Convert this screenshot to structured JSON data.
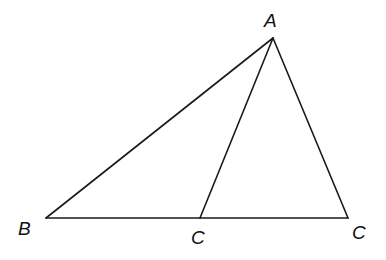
{
  "diagram": {
    "type": "triangle-with-cevian",
    "points": {
      "A": {
        "label": "A",
        "x": 273,
        "y": 38
      },
      "B": {
        "label": "B",
        "x": 46,
        "y": 218
      },
      "C_mid": {
        "label": "C",
        "x": 200,
        "y": 218
      },
      "C_right": {
        "label": "C",
        "x": 348,
        "y": 218
      }
    },
    "segments": [
      {
        "from": "A",
        "to": "B"
      },
      {
        "from": "B",
        "to": "C_right"
      },
      {
        "from": "A",
        "to": "C_right"
      },
      {
        "from": "A",
        "to": "C_mid"
      }
    ],
    "labels": {
      "A": "A",
      "B": "B",
      "C_mid": "C",
      "C_right": "C"
    },
    "line_color": "#1a1a1a",
    "background": "#ffffff"
  }
}
